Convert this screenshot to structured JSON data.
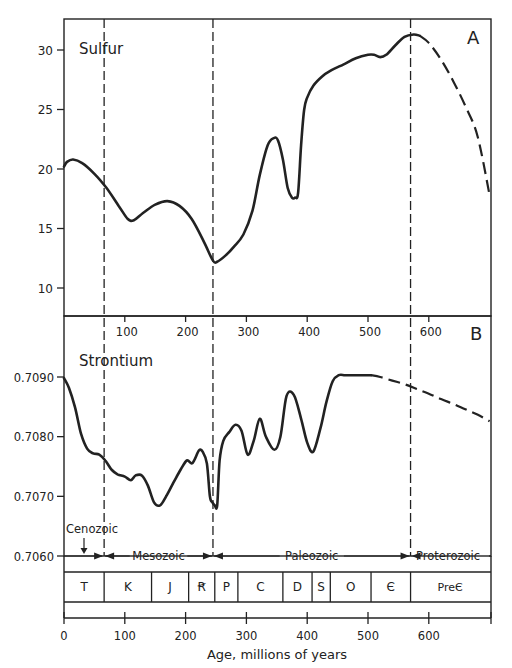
{
  "chart_data": [
    {
      "type": "line",
      "panel_label": "A",
      "title": "Sulfur",
      "xlabel": "Age, millions of years",
      "ylabel": "",
      "xlim": [
        0,
        700
      ],
      "ylim": [
        7.6,
        32.6
      ],
      "yticks": [
        10,
        15,
        20,
        25,
        30
      ],
      "xticks": [
        100,
        200,
        300,
        400,
        500,
        600
      ],
      "grid": false,
      "series": [
        {
          "name": "Sulfur (solid)",
          "style": "solid",
          "x": [
            0,
            5,
            15,
            30,
            50,
            70,
            90,
            105,
            115,
            130,
            150,
            170,
            190,
            210,
            230,
            245,
            252,
            265,
            280,
            295,
            310,
            322,
            335,
            345,
            352,
            360,
            368,
            375,
            380,
            385,
            390,
            395,
            400,
            410,
            425,
            440,
            460,
            480,
            500,
            510,
            520,
            530,
            545,
            560,
            575,
            585
          ],
          "values": [
            20.2,
            20.6,
            20.8,
            20.5,
            19.6,
            18.4,
            16.9,
            15.8,
            15.7,
            16.3,
            17.0,
            17.3,
            16.9,
            15.8,
            13.9,
            12.3,
            12.2,
            12.7,
            13.5,
            14.5,
            16.5,
            19.5,
            22.0,
            22.6,
            22.4,
            20.8,
            18.4,
            17.6,
            17.6,
            18.0,
            22.0,
            25.0,
            26.0,
            27.0,
            27.8,
            28.3,
            28.8,
            29.3,
            29.6,
            29.6,
            29.4,
            29.6,
            30.4,
            31.1,
            31.3,
            31.2
          ]
        },
        {
          "name": "Sulfur (dashed, extrapolated)",
          "style": "dashed",
          "x": [
            585,
            600,
            620,
            640,
            660,
            680,
            700
          ],
          "values": [
            31.2,
            30.6,
            29.2,
            27.4,
            25.3,
            22.8,
            17.8
          ]
        }
      ],
      "boundaries_dashed_x": [
        66,
        245,
        570
      ]
    },
    {
      "type": "line",
      "panel_label": "B",
      "title": "Strontium",
      "xlabel": "Age, millions of years",
      "ylabel": "",
      "xlim": [
        0,
        700
      ],
      "ylim": [
        0.706,
        0.7095
      ],
      "yticks": [
        0.706,
        0.707,
        0.708,
        0.709
      ],
      "ytick_labels": [
        "0.7060",
        "0.7070",
        "0.7080",
        "0.7090"
      ],
      "xticks": [
        0,
        100,
        200,
        300,
        400,
        500,
        600
      ],
      "grid": false,
      "series": [
        {
          "name": "Strontium (solid)",
          "style": "solid",
          "x": [
            0,
            8,
            18,
            28,
            38,
            48,
            58,
            68,
            78,
            88,
            100,
            110,
            118,
            128,
            138,
            148,
            158,
            168,
            180,
            192,
            202,
            210,
            215,
            222,
            228,
            235,
            240,
            244,
            248,
            252,
            256,
            262,
            272,
            282,
            292,
            302,
            312,
            322,
            332,
            346,
            356,
            366,
            378,
            390,
            400,
            410,
            422,
            432,
            442,
            452,
            462,
            474,
            486,
            496,
            505
          ],
          "values": [
            0.70898,
            0.70882,
            0.7085,
            0.70805,
            0.7078,
            0.70772,
            0.7077,
            0.7076,
            0.70745,
            0.70737,
            0.70733,
            0.70727,
            0.70735,
            0.70735,
            0.70718,
            0.7069,
            0.70685,
            0.707,
            0.70723,
            0.70745,
            0.7076,
            0.70755,
            0.70762,
            0.70777,
            0.70775,
            0.70755,
            0.707,
            0.7069,
            0.70685,
            0.70685,
            0.7076,
            0.70793,
            0.70808,
            0.7082,
            0.7081,
            0.7077,
            0.70793,
            0.7083,
            0.708,
            0.70778,
            0.708,
            0.70868,
            0.7087,
            0.7083,
            0.7079,
            0.70775,
            0.70815,
            0.7086,
            0.70893,
            0.70903,
            0.70903,
            0.70903,
            0.70903,
            0.70903,
            0.70903
          ]
        },
        {
          "name": "Strontium (dashed, extrapolated)",
          "style": "dashed",
          "x": [
            505,
            520,
            540,
            560,
            580,
            600,
            620,
            640,
            660,
            680,
            700
          ],
          "values": [
            0.70903,
            0.709,
            0.70894,
            0.70888,
            0.7088,
            0.70872,
            0.70863,
            0.70855,
            0.70846,
            0.70837,
            0.70826
          ]
        }
      ],
      "boundaries_dashed_x": [
        66,
        245,
        570
      ]
    }
  ],
  "panels": {
    "a": {
      "label": "A",
      "title": "Sulfur",
      "yticks": [
        "30",
        "25",
        "20",
        "15",
        "10"
      ],
      "xticks": [
        "100",
        "200",
        "300",
        "400",
        "500",
        "600"
      ]
    },
    "b": {
      "label": "B",
      "title": "Strontium",
      "yticks": [
        "0.7090",
        "0.7080",
        "0.7070",
        "0.7060"
      ]
    }
  },
  "eras": [
    {
      "name": "Cenozoic",
      "from": 0,
      "to": 66
    },
    {
      "name": "Mesozoic",
      "from": 66,
      "to": 245
    },
    {
      "name": "Paleozoic",
      "from": 245,
      "to": 570
    },
    {
      "name": "Proterozoic",
      "from": 570,
      "to": 700
    }
  ],
  "periods": [
    {
      "label": "T",
      "from": 0,
      "to": 66
    },
    {
      "label": "K",
      "from": 66,
      "to": 144
    },
    {
      "label": "J",
      "from": 144,
      "to": 205
    },
    {
      "label": "Ꞧ",
      "from": 205,
      "to": 248
    },
    {
      "label": "P",
      "from": 248,
      "to": 286
    },
    {
      "label": "C",
      "from": 286,
      "to": 360
    },
    {
      "label": "D",
      "from": 360,
      "to": 408
    },
    {
      "label": "S",
      "from": 408,
      "to": 438
    },
    {
      "label": "O",
      "from": 438,
      "to": 505
    },
    {
      "label": "Є",
      "from": 505,
      "to": 570
    },
    {
      "label": "PreЄ",
      "from": 570,
      "to": 700
    }
  ],
  "bottom_axis": {
    "ticks": [
      "0",
      "100",
      "200",
      "300",
      "400",
      "500",
      "600"
    ],
    "title": "Age, millions of years"
  },
  "colors": {
    "line": "#222222",
    "background": "#ffffff"
  }
}
